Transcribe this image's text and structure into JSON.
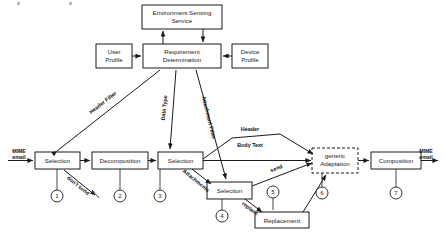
{
  "figure": {
    "background_color": "#ffffff",
    "line_color": "#1a1a1a"
  },
  "nodes": {
    "environment_sensing_service": {
      "line1": "Environment Sensing",
      "line2": "Service",
      "style": "solid"
    },
    "user_profile": {
      "line1": "User",
      "line2": "Profile",
      "style": "solid"
    },
    "requirement_determination": {
      "line1": "Requirement",
      "line2": "Determination",
      "style": "solid"
    },
    "device_profile": {
      "line1": "Device",
      "line2": "Profile",
      "style": "solid"
    },
    "selection_1": {
      "line1": "Selection",
      "style": "solid"
    },
    "decomposition_2": {
      "line1": "Decomposition",
      "style": "solid"
    },
    "selection_3": {
      "line1": "Selection",
      "style": "solid"
    },
    "selection_4": {
      "line1": "Selection",
      "style": "solid"
    },
    "replacement": {
      "line1": "Replacement",
      "style": "solid"
    },
    "generic_adaptation_6": {
      "line1": "generic",
      "line2": "Adaptation",
      "style": "dashed"
    },
    "composition_7": {
      "line1": "Composition",
      "style": "solid"
    }
  },
  "io": {
    "input": {
      "line1": "MIME",
      "line2": "email"
    },
    "output": {
      "line1": "MIME",
      "line2": "email"
    }
  },
  "edge_labels": {
    "header_filter": "Header Filter",
    "data_type": "Data Type",
    "attachment_filter": "Attachment Filter",
    "dont_send": "don't send",
    "attachments": "Attachments",
    "header": "Header",
    "body_text": "Body Text",
    "send": "send",
    "replace": "replace"
  },
  "step_numbers": {
    "step1": "1",
    "step2": "2",
    "step3": "3",
    "step4": "4",
    "step5": "5",
    "step6": "6",
    "step7": "7"
  }
}
